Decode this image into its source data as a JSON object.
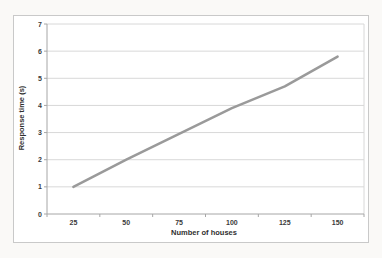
{
  "chart_data": {
    "type": "line",
    "categories": [
      "25",
      "50",
      "75",
      "100",
      "125",
      "150"
    ],
    "values": [
      1,
      2,
      2.95,
      3.9,
      4.7,
      5.8
    ],
    "xlabel": "Number of houses",
    "ylabel": "Response time (s)",
    "ylim": [
      0,
      7
    ],
    "yticks": [
      0,
      1,
      2,
      3,
      4,
      5,
      6,
      7
    ],
    "grid": "horizontal",
    "legend": "none",
    "colors": {
      "series_line": "#9a9a9a",
      "gridline": "#d8d8d8",
      "axis_line": "#a6a6a6",
      "plot_border": "#d8d8d8",
      "chart_border": "#c9c9c9",
      "chart_background": "#ffffff",
      "page_background": "#faf9f7",
      "text": "#3a3a3a"
    }
  }
}
